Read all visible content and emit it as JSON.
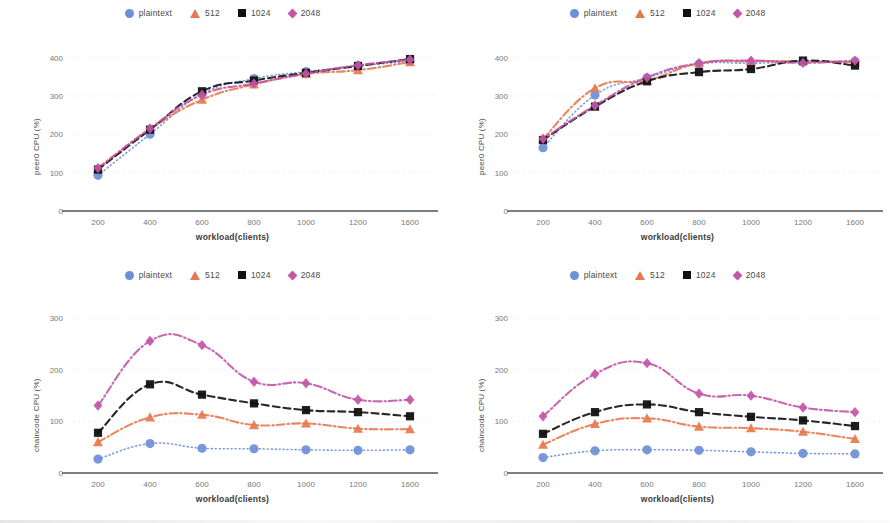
{
  "figure": {
    "background": "#ffffff",
    "panel_count": 4
  },
  "series_style": {
    "plaintext": {
      "color": "#6f8fd6",
      "marker": "circle",
      "dash": "dotted"
    },
    "512": {
      "color": "#e8784e",
      "marker": "triangle",
      "dash": "dashdot"
    },
    "1024": {
      "color": "#111111",
      "marker": "square",
      "dash": "dashed"
    },
    "2048": {
      "color": "#c256a8",
      "marker": "diamond",
      "dash": "dashdot"
    }
  },
  "legend": {
    "position": "top-center",
    "entries": [
      {
        "label": "plaintext",
        "marker": "circle-marker",
        "color": "#6f8fd6"
      },
      {
        "label": "512",
        "marker": "triangle-marker",
        "color": "#e8784e"
      },
      {
        "label": "1024",
        "marker": "square-marker",
        "color": "#111111"
      },
      {
        "label": "2048",
        "marker": "diamond-marker",
        "color": "#c256a8"
      }
    ]
  },
  "chart_data": [
    {
      "id": "top-left",
      "type": "line",
      "title": "",
      "xlabel": "workload(clients)",
      "ylabel": "peer0 CPU (%)",
      "categories": [
        "200",
        "400",
        "600",
        "800",
        "1000",
        "1200",
        "1600"
      ],
      "yticks": [
        0,
        100,
        200,
        300,
        400
      ],
      "ylim": [
        0,
        430
      ],
      "grid": true,
      "legend_position": "top-center",
      "series": [
        {
          "name": "plaintext",
          "values": [
            93,
            200,
            305,
            345,
            363,
            378,
            390
          ]
        },
        {
          "name": "512",
          "values": [
            110,
            213,
            290,
            330,
            357,
            367,
            388
          ]
        },
        {
          "name": "1024",
          "values": [
            108,
            212,
            312,
            340,
            360,
            378,
            396
          ]
        },
        {
          "name": "2048",
          "values": [
            112,
            215,
            303,
            332,
            358,
            380,
            394
          ]
        }
      ]
    },
    {
      "id": "top-right",
      "type": "line",
      "title": "",
      "xlabel": "workload(clients)",
      "ylabel": "peer0 CPU (%)",
      "categories": [
        "200",
        "400",
        "600",
        "800",
        "1000",
        "1200",
        "1600"
      ],
      "yticks": [
        0,
        100,
        200,
        300,
        400
      ],
      "ylim": [
        0,
        430
      ],
      "grid": true,
      "legend_position": "top-center",
      "series": [
        {
          "name": "plaintext",
          "values": [
            165,
            302,
            347,
            383,
            385,
            388,
            390
          ]
        },
        {
          "name": "512",
          "values": [
            188,
            320,
            340,
            385,
            390,
            390,
            388
          ]
        },
        {
          "name": "1024",
          "values": [
            185,
            272,
            338,
            362,
            370,
            392,
            379
          ]
        },
        {
          "name": "2048",
          "values": [
            188,
            275,
            348,
            385,
            392,
            386,
            392
          ]
        }
      ]
    },
    {
      "id": "bottom-left",
      "type": "line",
      "title": "",
      "xlabel": "workload(clients)",
      "ylabel": "chaincode CPU (%)",
      "categories": [
        "200",
        "400",
        "600",
        "800",
        "1000",
        "1200",
        "1600"
      ],
      "yticks": [
        0,
        100,
        200,
        300
      ],
      "ylim": [
        0,
        320
      ],
      "grid": true,
      "legend_position": "top-center",
      "series": [
        {
          "name": "plaintext",
          "values": [
            27,
            57,
            48,
            47,
            45,
            44,
            45
          ]
        },
        {
          "name": "512",
          "values": [
            60,
            108,
            113,
            93,
            96,
            86,
            85
          ]
        },
        {
          "name": "1024",
          "values": [
            78,
            172,
            152,
            135,
            122,
            118,
            110
          ]
        },
        {
          "name": "2048",
          "values": [
            131,
            256,
            248,
            177,
            174,
            142,
            142
          ]
        }
      ]
    },
    {
      "id": "bottom-right",
      "type": "line",
      "title": "",
      "xlabel": "workload(clients)",
      "ylabel": "chaincode CPU (%)",
      "categories": [
        "200",
        "400",
        "600",
        "800",
        "1000",
        "1200",
        "1600"
      ],
      "yticks": [
        0,
        100,
        200,
        300
      ],
      "ylim": [
        0,
        320
      ],
      "grid": true,
      "legend_position": "top-center",
      "series": [
        {
          "name": "plaintext",
          "values": [
            30,
            43,
            45,
            44,
            41,
            38,
            37
          ]
        },
        {
          "name": "512",
          "values": [
            55,
            95,
            106,
            90,
            87,
            80,
            66
          ]
        },
        {
          "name": "1024",
          "values": [
            76,
            118,
            133,
            118,
            109,
            102,
            91
          ]
        },
        {
          "name": "2048",
          "values": [
            110,
            192,
            213,
            154,
            150,
            127,
            118
          ]
        }
      ]
    }
  ]
}
